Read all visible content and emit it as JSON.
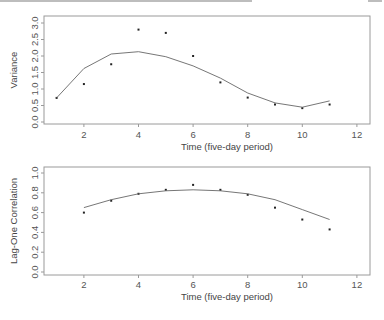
{
  "chart_data": [
    {
      "type": "scatter",
      "title": "",
      "xlabel": "Time (five-day period)",
      "ylabel": "Variance",
      "xlim": [
        0.5,
        12.5
      ],
      "ylim": [
        0.0,
        3.0
      ],
      "xticks": [
        2,
        4,
        6,
        8,
        10,
        12
      ],
      "yticks": [
        "0.0",
        "0.5",
        "1.0",
        "1.5",
        "2.0",
        "2.5",
        "3.0"
      ],
      "grid": false,
      "legend": null,
      "series": [
        {
          "name": "observed",
          "kind": "points",
          "x": [
            1,
            2,
            3,
            4,
            5,
            6,
            7,
            8,
            9,
            10,
            11
          ],
          "y": [
            0.73,
            1.15,
            1.75,
            2.8,
            2.7,
            2.0,
            1.2,
            0.74,
            0.53,
            0.42,
            0.53
          ]
        },
        {
          "name": "fitted",
          "kind": "line",
          "x": [
            1,
            2,
            3,
            4,
            5,
            6,
            7,
            8,
            9,
            10,
            11
          ],
          "y": [
            0.73,
            1.62,
            2.06,
            2.13,
            1.98,
            1.7,
            1.33,
            0.88,
            0.58,
            0.45,
            0.64
          ]
        }
      ]
    },
    {
      "type": "scatter",
      "title": "",
      "xlabel": "Time (five-day period)",
      "ylabel": "Lag-One Correlation",
      "xlim": [
        0.5,
        12.5
      ],
      "ylim": [
        0.0,
        1.0
      ],
      "xticks": [
        2,
        4,
        6,
        8,
        10,
        12
      ],
      "yticks": [
        "0.0",
        "0.2",
        "0.4",
        "0.6",
        "0.8",
        "1.0"
      ],
      "grid": false,
      "legend": null,
      "series": [
        {
          "name": "observed",
          "kind": "points",
          "x": [
            2,
            3,
            4,
            5,
            6,
            7,
            8,
            9,
            10,
            11
          ],
          "y": [
            0.6,
            0.72,
            0.79,
            0.83,
            0.88,
            0.83,
            0.78,
            0.65,
            0.53,
            0.43
          ]
        },
        {
          "name": "fitted",
          "kind": "line",
          "x": [
            2,
            3,
            4,
            5,
            6,
            7,
            8,
            9,
            10,
            11
          ],
          "y": [
            0.65,
            0.73,
            0.79,
            0.82,
            0.83,
            0.82,
            0.79,
            0.73,
            0.63,
            0.53
          ]
        }
      ]
    }
  ],
  "panels": [
    {
      "ylabel": "Variance",
      "xlabel": "Time (five-day period)"
    },
    {
      "ylabel": "Lag-One Correlation",
      "xlabel": "Time (five-day period)"
    }
  ]
}
